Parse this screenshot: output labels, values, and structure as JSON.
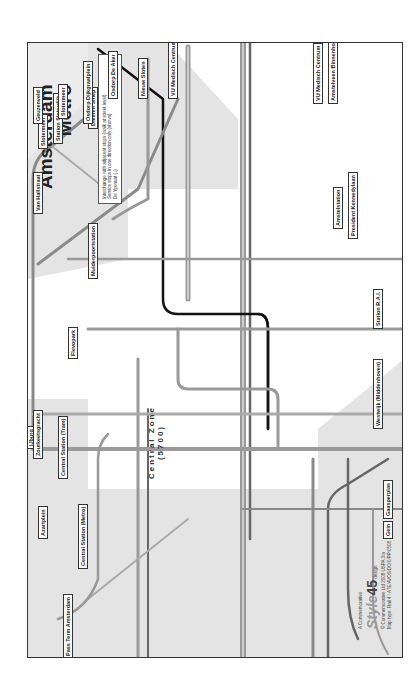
{
  "map": {
    "title": "Amsterdam",
    "subtitle": "Metro",
    "zone_label": "Central Zone",
    "zone_code": "(5700)",
    "colors": {
      "line_gray": "#9a9a9a",
      "line_dark": "#5a5a5a",
      "line_black": "#111111",
      "shade": "#e3e3e3",
      "frame": "#333333"
    },
    "legend": {
      "item1": "Interchange with adjacent stops (walk at street level)",
      "item2_prefix": "De Ypenuat (↓)",
      "item2": "Service stops in one direction only (shown)"
    },
    "terminals": [
      {
        "name": "Azartplein",
        "num": "10"
      },
      {
        "name": "IJburg",
        "num": "26"
      },
      {
        "name": "Flevopark",
        "num": "14 7"
      },
      {
        "name": "Muiderpoortstation",
        "num": "3"
      },
      {
        "name": "Diemen Sniep",
        "num": "9"
      },
      {
        "name": "Pass Term Amsterdam",
        "num": "25"
      },
      {
        "name": "Central Station (Metro)",
        "num": ""
      },
      {
        "name": "Central Station (Tram)",
        "num": ""
      },
      {
        "name": "Zoutkeetsgracht",
        "num": "3"
      },
      {
        "name": "Van Hallstraat",
        "num": "10"
      },
      {
        "name": "Slotermeer",
        "num": "14"
      },
      {
        "name": "Station Sloterdijk",
        "num": "12"
      },
      {
        "name": "Geuzenveld",
        "num": "13"
      },
      {
        "name": "Slotermeer",
        "num": "7"
      },
      {
        "name": "Osdorp Dijkgraafplein",
        "num": "17"
      },
      {
        "name": "Osdorp De Aker",
        "num": "1"
      },
      {
        "name": "Nieuw Sloten",
        "num": "2"
      },
      {
        "name": "VU Medisch Centrum",
        "num": "16"
      },
      {
        "name": "VU Medisch Centrum",
        "num": "24"
      },
      {
        "name": "Amstelveen Binnenhof",
        "num": "5"
      },
      {
        "name": "Amstelstation",
        "num": "12"
      },
      {
        "name": "President Kennedylaan",
        "num": "25"
      },
      {
        "name": "Station R.A.I.",
        "num": "4"
      },
      {
        "name": "Westwijk (Middenhoven)",
        "num": "51"
      },
      {
        "name": "Gaasperplas",
        "num": "53"
      },
      {
        "name": "Gein",
        "num": "54"
      }
    ],
    "stations": [
      "Steigereiland",
      "Zuiderzeeweg",
      "C. Van Eesterenlaan",
      "Rietlandpark",
      "Insulindeweg",
      "Soembawastraat",
      "Javaplein",
      "Molukkenstraat",
      "Ie Leeghwaterstraat",
      "Ie Coehoornstraat",
      "Zeeburgerdijk",
      "Hoogte Kadijk",
      "Dapperstraat",
      "Linnaeusstraat",
      "Wibautstraat",
      "Boukersweg",
      "Ie van Swindenstraat",
      "Alexanderplein",
      "Oosterpark",
      "Camperstraat",
      "Pontanusstraat",
      "Mauritskade",
      "Plantage Badlaan",
      "Plantage Kerklaan",
      "Korte 's-Gravesandestraat",
      "Wibautstraat",
      "Wibautstraat",
      "Kattenburgerstraat",
      "Muziekgebouw Bimhuis",
      "Nieuwmarkt",
      "Waterlooplein",
      "Mr. Visserplein",
      "Oostenade",
      "Weesperplein",
      "Frederiksplein",
      "Stadhouderskade",
      "Ferdinand Bolstraat/ Ceintuurbaan",
      "Van Woustraat/ Ceintuurbaan",
      "Amsteldijk",
      "Lutmastraat",
      "Amstelkade/ Jozef Israëlskade",
      "Ie van der Helststraat",
      "Stopkade",
      "Spui",
      "Muntplein",
      "Rembrandtplein",
      "Keizersgracht",
      "Prinsengracht",
      "Dam",
      "Dam",
      "Dam",
      "Dam",
      "Westermarkt",
      "Marnixstraat",
      "Haarlemmerplein",
      "Nieuwe Willemsstraat",
      "Rozengracht",
      "11 Martelaarsgracht",
      "Nieuwezijds Kolk",
      "Koningsplein",
      "Leidseplein",
      "Leidseplein",
      "Elandsgracht",
      "Raamplein",
      "Weteringcircuit",
      "Spiegelgracht",
      "Stadhouderskade",
      "Albert Cuypstraat",
      "Ruysdaelstraat",
      "Ruysdaelkade",
      "Cornelis Troostplein",
      "Scheldestraat",
      "Van Limburg Stirumplein",
      "De Wittenkade",
      "Nassaukade",
      "Marnixplein",
      "Frederik Hendrikplantsoen",
      "Hugo de Grootplein",
      "Bilderdijkstraat/ De Clercqstraat",
      "Willem de Zwijgerlaan",
      "Elisabeth Wolffstraat",
      "Kinkerstraat/ Bilderdijkstraat",
      "Ten Katestraat",
      "Ie Constantijn Huygensstraat",
      "Jan Pieter Heijestraat",
      "Vondelpark",
      "Rhijnvis Feithstraat",
      "Cornelis Schuytstraat",
      "Jacob Obrechtstraat",
      "Overtoom",
      "Hobbemastraat",
      "Van Baerlestraat",
      "Museumplein",
      "Roelof Hartplein",
      "Apollolaan",
      "Gerrit van der Veenstraat",
      "Stadionweg",
      "Stadhouderskade",
      "Jacob Obrechtstraat",
      "Cornelis Schuytstraat"
    ]
  },
  "footer": {
    "line1": "A Commemorative",
    "brand": "Style",
    "brand_num": "45",
    "brand_suffix": "design",
    "line2": "© Commemorative Ltd 2008 USPA 3/a",
    "line3": "Map type: Rail 4 / ATE/AVOS/DO/0/PP/0508"
  }
}
